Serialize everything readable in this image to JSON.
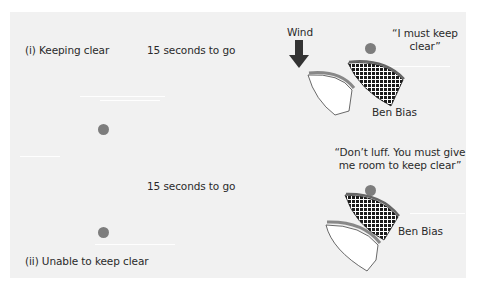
{
  "diagram": {
    "scenario_1": {
      "label": "(i)  Keeping clear",
      "time": "15 seconds to go",
      "wind_label": "Wind",
      "quote_line1": "“I must keep",
      "quote_line2": "clear”",
      "boat_name": "Ben Bias"
    },
    "scenario_2": {
      "label": "(ii) Unable to keep clear",
      "time": "15 seconds to go",
      "quote_line1": "“Don’t luff. You must give",
      "quote_line2": "me room to keep clear”",
      "boat_name": "Ben Bias"
    },
    "colors": {
      "background": "#f1f1f1",
      "mark": "#7d7d7d",
      "boat_hull_white": "#ffffff",
      "boat_hatched": "#1a1a1a",
      "boat_rail": "#888888",
      "wind_arrow": "#333333"
    }
  }
}
